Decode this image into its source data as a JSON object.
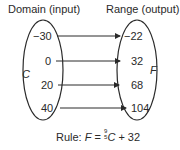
{
  "domain_title": "Domain (input)",
  "range_title": "Range (output)",
  "domain_var": "C",
  "range_var": "F",
  "domain_values": [
    "−30",
    "0",
    "20",
    "40"
  ],
  "range_values": [
    "−22",
    "32",
    "68",
    "104"
  ],
  "mappings": [
    {
      "from": "−30",
      "to": "−22"
    },
    {
      "from": "0",
      "to": "32"
    },
    {
      "from": "20",
      "to": "68"
    },
    {
      "from": "40",
      "to": "104"
    }
  ],
  "rule": {
    "prefix": "Rule: ",
    "lhs": "F",
    "eq": " = ",
    "num": "9",
    "den": "5",
    "var": "C",
    "suffix": " + 32"
  }
}
